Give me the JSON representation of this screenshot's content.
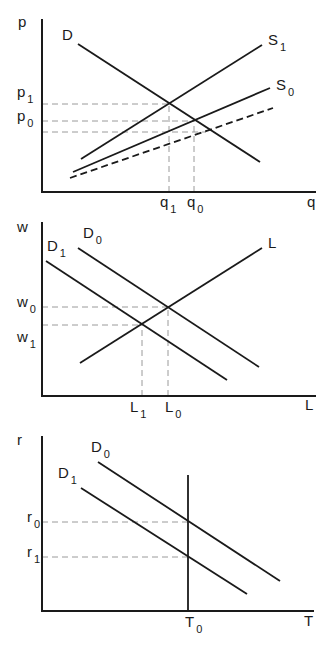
{
  "figure": {
    "panels": [
      {
        "id": "goods-market",
        "axis": {
          "origin": [
            42,
            192
          ],
          "top": 19,
          "right": 316,
          "y_label": "p",
          "x_label": "q",
          "y_label_pos": [
            18,
            27
          ],
          "x_label_pos": [
            307,
            207
          ]
        },
        "curves": [
          {
            "name": "D",
            "label": "D",
            "sub": "",
            "from": [
              78,
              44
            ],
            "to": [
              260,
              162
            ],
            "dashed": false,
            "label_pos": [
              62,
              40
            ]
          },
          {
            "name": "S1",
            "label": "S",
            "sub": "1",
            "from": [
              81,
              159
            ],
            "to": [
              262,
              45
            ],
            "dashed": false,
            "label_pos": [
              268,
              45
            ]
          },
          {
            "name": "S0",
            "label": "S",
            "sub": "0",
            "from": [
              73,
              172
            ],
            "to": [
              270,
              88
            ],
            "dashed": false,
            "label_pos": [
              276,
              90
            ]
          },
          {
            "name": "S-shifted",
            "label": "",
            "sub": "",
            "from": [
              70,
              178
            ],
            "to": [
              273,
              108
            ],
            "dashed": true,
            "label_pos": null
          }
        ],
        "guides": [
          {
            "name": "p1-guide",
            "axis": "y",
            "value": 104,
            "to": 169
          },
          {
            "name": "p0-guide",
            "axis": "y",
            "value": 121,
            "to": 194
          },
          {
            "name": "p-lower-guide",
            "axis": "y",
            "value": 132,
            "to": 206
          },
          {
            "name": "q1-guide",
            "axis": "x",
            "value": 169,
            "to": 104
          },
          {
            "name": "q0-guide",
            "axis": "x",
            "value": 194,
            "to": 121
          }
        ],
        "ticks": [
          {
            "name": "p1",
            "label": "p",
            "sub": "1",
            "pos": [
              17,
              97
            ]
          },
          {
            "name": "p0",
            "label": "p",
            "sub": "0",
            "pos": [
              17,
              121
            ]
          },
          {
            "name": "q1",
            "label": "q",
            "sub": "1",
            "pos": [
              160,
              207
            ]
          },
          {
            "name": "q0",
            "label": "q",
            "sub": "0",
            "pos": [
              187,
              207
            ]
          }
        ]
      },
      {
        "id": "labor-market",
        "axis": {
          "origin": [
            42,
            396
          ],
          "top": 222,
          "right": 316,
          "y_label": "w",
          "x_label": "L",
          "y_label_pos": [
            17,
            232
          ],
          "x_label_pos": [
            305,
            410
          ]
        },
        "curves": [
          {
            "name": "D1",
            "label": "D",
            "sub": "1",
            "from": [
              46,
              261
            ],
            "to": [
              227,
              380
            ],
            "dashed": false,
            "label_pos": [
              47,
              251
            ]
          },
          {
            "name": "D0",
            "label": "D",
            "sub": "0",
            "from": [
              78,
              248
            ],
            "to": [
              259,
              367
            ],
            "dashed": false,
            "label_pos": [
              83,
              238
            ]
          },
          {
            "name": "L",
            "label": "L",
            "sub": "",
            "from": [
              80,
              363
            ],
            "to": [
              262,
              248
            ],
            "dashed": false,
            "label_pos": [
              268,
              248
            ]
          }
        ],
        "guides": [
          {
            "name": "w0-guide",
            "axis": "y",
            "value": 307,
            "to": 168
          },
          {
            "name": "w1-guide",
            "axis": "y",
            "value": 325,
            "to": 142
          },
          {
            "name": "L1-guide",
            "axis": "x",
            "value": 142,
            "to": 325
          },
          {
            "name": "L0-guide",
            "axis": "x",
            "value": 168,
            "to": 307
          }
        ],
        "ticks": [
          {
            "name": "w0",
            "label": "w",
            "sub": "0",
            "pos": [
              17,
              307
            ]
          },
          {
            "name": "w1",
            "label": "w",
            "sub": "1",
            "pos": [
              17,
              342
            ]
          },
          {
            "name": "L1",
            "label": "L",
            "sub": "1",
            "pos": [
              130,
              412
            ]
          },
          {
            "name": "L0",
            "label": "L",
            "sub": "0",
            "pos": [
              165,
              412
            ]
          }
        ]
      },
      {
        "id": "land-market",
        "axis": {
          "origin": [
            42,
            611
          ],
          "top": 436,
          "right": 314,
          "y_label": "r",
          "x_label": "T",
          "y_label_pos": [
            17,
            445
          ],
          "x_label_pos": [
            304,
            626
          ]
        },
        "curves": [
          {
            "name": "D0",
            "label": "D",
            "sub": "0",
            "from": [
              98,
              462
            ],
            "to": [
              280,
              581
            ],
            "dashed": false,
            "label_pos": [
              91,
              452
            ]
          },
          {
            "name": "D1",
            "label": "D",
            "sub": "1",
            "from": [
              81,
              488
            ],
            "to": [
              247,
              594
            ],
            "dashed": false,
            "label_pos": [
              58,
              478
            ]
          },
          {
            "name": "T0-supply",
            "label": "",
            "sub": "",
            "from": [
              188,
              475
            ],
            "to": [
              188,
              611
            ],
            "dashed": false,
            "label_pos": null
          }
        ],
        "guides": [
          {
            "name": "r0-guide",
            "axis": "y",
            "value": 522,
            "to": 188
          },
          {
            "name": "r1-guide",
            "axis": "y",
            "value": 557,
            "to": 188
          }
        ],
        "ticks": [
          {
            "name": "r0",
            "label": "r",
            "sub": "0",
            "pos": [
              27,
              522
            ]
          },
          {
            "name": "r1",
            "label": "r",
            "sub": "1",
            "pos": [
              27,
              557
            ]
          },
          {
            "name": "T0",
            "label": "T",
            "sub": "0",
            "pos": [
              185,
              627
            ]
          }
        ]
      }
    ],
    "colors": {
      "line": "#1a1a1a",
      "guide": "#9a9a9a",
      "background": "#ffffff"
    }
  }
}
